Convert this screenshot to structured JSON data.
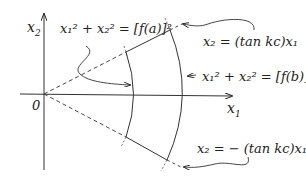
{
  "axes": {
    "x_label": "x",
    "x_sub": "1",
    "y_label": "x",
    "y_sub": "2",
    "origin": "0"
  },
  "annotations": {
    "inner_arc": {
      "lhs": "x₁² + x₂² = ",
      "rhs": "[f(a)]²"
    },
    "outer_arc": {
      "lhs": "x₁² + x₂² = ",
      "rhs": "[f(b)]²"
    },
    "upper_ray": {
      "text": "x₂ = (tan kc)x₁"
    },
    "lower_ray": {
      "text": "x₂ = − (tan kc)x₁"
    }
  },
  "colors": {
    "ink": "#222222",
    "background": "#ffffff"
  }
}
